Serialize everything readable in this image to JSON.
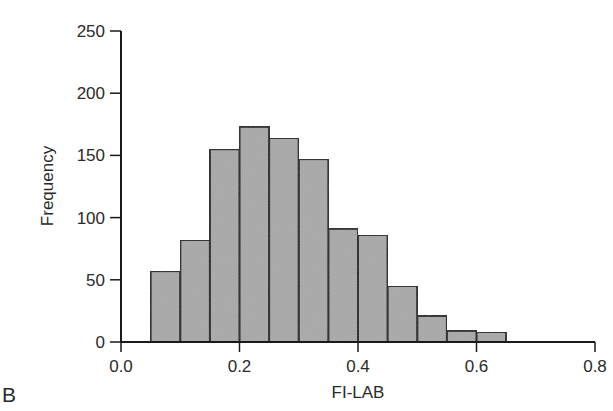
{
  "chart_data": {
    "type": "bar",
    "subtype": "histogram",
    "title": "",
    "panel_label": "B",
    "xlabel": "FI-LAB",
    "ylabel": "Frequency",
    "xlim": [
      0.0,
      0.8
    ],
    "ylim": [
      0,
      250
    ],
    "x_ticks": [
      "0.0",
      "0.2",
      "0.4",
      "0.6",
      "0.8"
    ],
    "x_tick_values": [
      0.0,
      0.2,
      0.4,
      0.6,
      0.8
    ],
    "y_ticks": [
      "0",
      "50",
      "100",
      "150",
      "200",
      "250"
    ],
    "y_tick_values": [
      0,
      50,
      100,
      150,
      200,
      250
    ],
    "grid": false,
    "legend": null,
    "bin_width": 0.05,
    "bin_edges": [
      0.05,
      0.1,
      0.15,
      0.2,
      0.25,
      0.3,
      0.35,
      0.4,
      0.45,
      0.5,
      0.55,
      0.6,
      0.65
    ],
    "categories": [
      "0.05-0.10",
      "0.10-0.15",
      "0.15-0.20",
      "0.20-0.25",
      "0.25-0.30",
      "0.30-0.35",
      "0.35-0.40",
      "0.40-0.45",
      "0.45-0.50",
      "0.50-0.55",
      "0.55-0.60",
      "0.60-0.65"
    ],
    "values": [
      57,
      82,
      155,
      173,
      164,
      147,
      91,
      86,
      45,
      21,
      9,
      8
    ],
    "bar_color": "#a9a9a9",
    "bar_edge_color": "#1a1a1a"
  }
}
